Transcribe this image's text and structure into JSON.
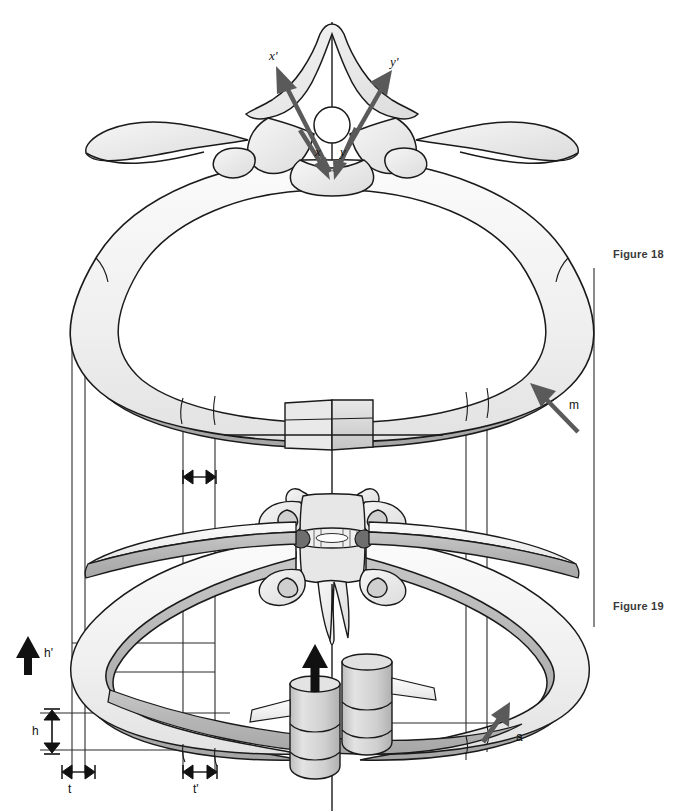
{
  "figure": {
    "background": "#ffffff",
    "width": 690,
    "height": 811
  },
  "captions": [
    {
      "id": "figure-18",
      "label": "Figure 18",
      "x": 613,
      "y": 248
    },
    {
      "id": "figure-19",
      "label": "Figure 19",
      "x": 613,
      "y": 600
    }
  ],
  "axis_labels": [
    {
      "name": "x-prime",
      "label": "x'",
      "x": 271,
      "y": 57
    },
    {
      "name": "y-prime",
      "label": "y'",
      "x": 393,
      "y": 63
    },
    {
      "name": "x",
      "label": "x",
      "x": 318,
      "y": 152
    },
    {
      "name": "y",
      "label": "y",
      "x": 342,
      "y": 152
    }
  ],
  "vector_labels": [
    {
      "name": "m-vector",
      "label": "m",
      "x": 571,
      "y": 405
    },
    {
      "name": "a-vector",
      "label": "a",
      "x": 518,
      "y": 737
    }
  ],
  "dimension_labels": [
    {
      "name": "h-prime",
      "label": "h'",
      "x": 46,
      "y": 653
    },
    {
      "name": "h",
      "label": "h",
      "x": 36,
      "y": 731
    },
    {
      "name": "t",
      "label": "t",
      "x": 70,
      "y": 789
    },
    {
      "name": "t-prime",
      "label": "t'",
      "x": 196,
      "y": 789
    }
  ],
  "colors": {
    "outline": "#1a1a1a",
    "bone_light": "#f2f2f2",
    "bone_mid": "#d9d9d9",
    "bone_shadow": "#b5b5b5",
    "bone_dark": "#9a9a9a",
    "arrow_gray": "#5a5a5a",
    "arrow_black": "#111111",
    "guide_line": "#2b2b2b",
    "caption_text": "#3a3a3a"
  },
  "elements": {
    "upper_vertebra": "thoracic vertebra, superior (axial) view with spinous and transverse processes",
    "upper_rib_ring": "horizontal rib ring, superior view, Figure 18",
    "sternum_block": "sternum rendered as a central rectangular block on the anterior ring",
    "lower_vertebra": "thoracic vertebra, oblique view with intervertebral disc, Figure 19",
    "lower_rib_ring": "oblique rib ring, Figure 19",
    "vertebral_bodies": "two stacked cylindrical vertebral body segments",
    "elevation_arrow": "thick black arrow indicating rib elevation",
    "vertical_axis": "central sagittal reference axis"
  }
}
